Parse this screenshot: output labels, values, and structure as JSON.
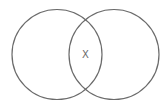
{
  "diagram": {
    "type": "venn",
    "sets": [
      {
        "name": "left-set"
      },
      {
        "name": "right-set"
      }
    ],
    "intersection_label": "X",
    "stroke_color": "#6b6b6b",
    "label_color": "#6b6b6b"
  }
}
